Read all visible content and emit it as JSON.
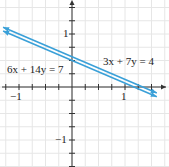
{
  "chart_data": {
    "type": "line",
    "title": "",
    "xlabel": "x",
    "ylabel": "y",
    "xlim": [
      -1.35,
      1.7
    ],
    "ylim": [
      -1.55,
      1.65
    ],
    "grid": true,
    "x_tick_labels": [
      "-1",
      "1"
    ],
    "y_tick_labels": [
      "1",
      "-1"
    ],
    "tick_step": 0.25,
    "series": [
      {
        "name": "6x + 14y = 7",
        "equation": "6x + 14y = 7",
        "slope": -0.4286,
        "intercept": 0.5,
        "color": "#3aa0d8"
      },
      {
        "name": "3x + 7y = 4",
        "equation": "3x + 7y = 4",
        "slope": -0.4286,
        "intercept": 0.5714,
        "color": "#3aa0d8"
      }
    ],
    "annotations": [
      "6x + 14y = 7",
      "3x + 7y = 4"
    ]
  },
  "labels": {
    "eq1": "6x + 14y = 7",
    "eq2": "3x + 7y = 4",
    "x_neg1": "−1",
    "x_pos1": "1",
    "y_pos1": "1",
    "y_neg1": "−1",
    "x_axis": "x",
    "y_axis": "y"
  }
}
